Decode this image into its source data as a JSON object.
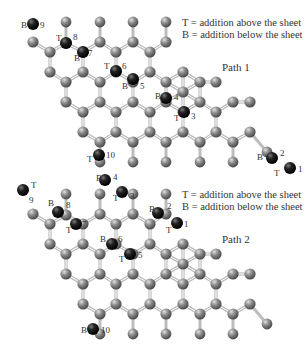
{
  "figure": {
    "panels": [
      {
        "title": "Path 1",
        "legend": [
          "T = addition above the sheet",
          "B = addition below the sheet"
        ],
        "legend_pos": [
          180,
          20
        ],
        "title_pos": [
          222,
          61
        ],
        "offset": [
          0,
          0
        ],
        "steps": [
          {
            "n": "1",
            "side": "T",
            "x": 290,
            "y": 168,
            "lx_side": 274,
            "ly_side": 176,
            "lx_n": 298,
            "ly_n": 172
          },
          {
            "n": "2",
            "side": "B",
            "x": 272,
            "y": 158,
            "lx_side": 257,
            "ly_side": 160,
            "lx_n": 280,
            "ly_n": 156
          },
          {
            "n": "3",
            "side": "T",
            "x": 184,
            "y": 112,
            "lx_side": 174,
            "ly_side": 121,
            "lx_n": 191,
            "ly_n": 119
          },
          {
            "n": "4",
            "side": "B",
            "x": 166,
            "y": 98,
            "lx_side": 155,
            "ly_side": 99,
            "lx_n": 174,
            "ly_n": 100
          },
          {
            "n": "5",
            "side": "B",
            "x": 133,
            "y": 79,
            "lx_side": 122,
            "ly_side": 89,
            "lx_n": 140,
            "ly_n": 89
          },
          {
            "n": "6",
            "side": "T",
            "x": 116,
            "y": 71,
            "lx_side": 104,
            "ly_side": 69,
            "lx_n": 122,
            "ly_n": 69
          },
          {
            "n": "7",
            "side": "B",
            "x": 83,
            "y": 52,
            "lx_side": 74,
            "ly_side": 61,
            "lx_n": 88,
            "ly_n": 56
          },
          {
            "n": "8",
            "side": "T",
            "x": 66,
            "y": 43,
            "lx_side": 56,
            "ly_side": 41,
            "lx_n": 73,
            "ly_n": 40
          },
          {
            "n": "9",
            "side": "B",
            "x": 33,
            "y": 24,
            "lx_side": 21,
            "ly_side": 28,
            "lx_n": 40,
            "ly_n": 28
          },
          {
            "n": "10",
            "side": "T",
            "x": 99,
            "y": 155,
            "lx_side": 87,
            "ly_side": 162,
            "lx_n": 106,
            "ly_n": 158
          }
        ]
      },
      {
        "title": "Path 2",
        "legend": [
          "T = addition above the sheet",
          "B = addition below the sheet"
        ],
        "legend_pos": [
          180,
          193
        ],
        "title_pos": [
          222,
          233
        ],
        "offset": [
          0,
          172
        ],
        "steps": [
          {
            "n": "1",
            "side": "T",
            "x": 177,
            "y": 51,
            "lx_side": 166,
            "ly_side": 61,
            "lx_n": 184,
            "ly_n": 55
          },
          {
            "n": "2",
            "side": "B",
            "x": 158,
            "y": 41,
            "lx_side": 149,
            "ly_side": 40,
            "lx_n": 167,
            "ly_n": 37
          },
          {
            "n": "3",
            "side": "T",
            "x": 122,
            "y": 20,
            "lx_side": 113,
            "ly_side": 29,
            "lx_n": 130,
            "ly_n": 27
          },
          {
            "n": "4",
            "side": "B",
            "x": 105,
            "y": 8,
            "lx_side": 96,
            "ly_side": 9,
            "lx_n": 113,
            "ly_n": 8
          },
          {
            "n": "5",
            "side": "T",
            "x": 130,
            "y": 82,
            "lx_side": 119,
            "ly_side": 90,
            "lx_n": 138,
            "ly_n": 86
          },
          {
            "n": "6",
            "side": "B",
            "x": 112,
            "y": 72,
            "lx_side": 100,
            "ly_side": 70,
            "lx_n": 118,
            "ly_n": 70
          },
          {
            "n": "7",
            "side": "T",
            "x": 76,
            "y": 52,
            "lx_side": 66,
            "ly_side": 61,
            "lx_n": 82,
            "ly_n": 55
          },
          {
            "n": "8",
            "side": "B",
            "x": 58,
            "y": 40,
            "lx_side": 48,
            "ly_side": 34,
            "lx_n": 66,
            "ly_n": 36
          },
          {
            "n": "9",
            "side": "T",
            "x": 23,
            "y": 18,
            "lx_side": 31,
            "ly_side": 16,
            "lx_n": 29,
            "ly_n": 31
          },
          {
            "n": "10",
            "side": "B",
            "x": 93,
            "y": 157,
            "lx_side": 81,
            "ly_side": 161,
            "lx_n": 101,
            "ly_n": 161
          }
        ]
      }
    ]
  },
  "colors": {
    "carbon": "#8a8a8a",
    "hydrogen": "#8f8f8f",
    "highlight": "#1e1e1e",
    "bond": "#bdbdbd",
    "text": "#333333"
  }
}
